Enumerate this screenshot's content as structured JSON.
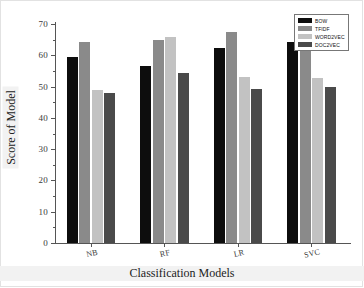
{
  "chart_data": {
    "type": "bar",
    "title": "",
    "xlabel": "Classification Models",
    "ylabel": "Score of Model",
    "categories": [
      "NB",
      "RF",
      "LR",
      "SVC"
    ],
    "ylim": [
      0,
      70
    ],
    "yticks": [
      0,
      10,
      20,
      30,
      40,
      50,
      60,
      70
    ],
    "ytick_labels": [
      "0",
      "10",
      "20",
      "30",
      "40",
      "50",
      "60",
      "70"
    ],
    "y_minor_ticks": [
      5,
      15,
      25,
      35,
      45,
      55,
      65
    ],
    "grid": false,
    "legend_position": "upper right",
    "series": [
      {
        "name": "BOW",
        "color": "#0d0d0d",
        "values": [
          59.5,
          56.5,
          62.3,
          64.3
        ]
      },
      {
        "name": "TFIDF",
        "color": "#8a8a8a",
        "values": [
          64.1,
          64.8,
          67.3,
          66.6
        ]
      },
      {
        "name": "WORD2VEC",
        "color": "#c2c2c2",
        "values": [
          48.9,
          65.8,
          53.2,
          52.7
        ]
      },
      {
        "name": "DOC2VEC",
        "color": "#4a4a4a",
        "values": [
          48.1,
          54.3,
          49.3,
          50.0
        ]
      }
    ]
  }
}
